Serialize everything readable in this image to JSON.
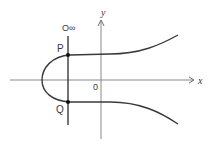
{
  "diagram": {
    "type": "elliptic-curve",
    "axes": {
      "x_label": "x",
      "y_label": "y",
      "origin_label": "0"
    },
    "points": {
      "P": "P",
      "Q": "Q",
      "infinity": "O∞"
    },
    "colors": {
      "curve": "#3a3a3a",
      "axis": "#8a8a8a",
      "line": "#2a2a2a",
      "point": "#111111"
    }
  }
}
